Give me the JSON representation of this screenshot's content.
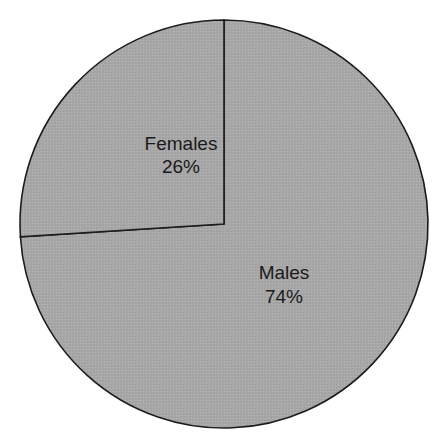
{
  "chart_data": {
    "type": "pie",
    "title": "",
    "categories": [
      "Males",
      "Females"
    ],
    "values": [
      74,
      26
    ],
    "unit": "%",
    "labels": [
      {
        "name": "Males",
        "value_text": "74%"
      },
      {
        "name": "Females",
        "value_text": "26%"
      }
    ],
    "start_angle": "12 o'clock",
    "direction": "Females counterclockwise from top; Males remainder",
    "legend": "none (inline labels)"
  },
  "colors": {
    "slice_fill": "#a9a9a9",
    "outline": "#1c1c1c",
    "text": "#1a1a1a",
    "background": "#ffffff"
  }
}
